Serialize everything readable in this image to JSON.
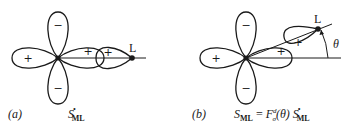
{
  "panel_a": {
    "tag": "(a)",
    "ligand_label": "L",
    "signs": {
      "top": "−",
      "bottom": "−",
      "left": "+",
      "right": "+",
      "ligand": "+"
    },
    "formula": {
      "S": "S",
      "star": "•",
      "sub": "ML"
    }
  },
  "panel_b": {
    "tag": "(b)",
    "ligand_label": "L",
    "angle_label": "θ",
    "angle_deg": 22,
    "signs": {
      "top": "−",
      "bottom": "−",
      "left": "+",
      "right": "+",
      "ligand": "+"
    },
    "formula": {
      "lhs": "S",
      "lhs_sub": "ML",
      "eq": " = ",
      "F": "F",
      "F_sup": "d",
      "F_sub": "σ",
      "arg": "(θ) ",
      "rhs": "S",
      "rhs_star": "•",
      "rhs_sub": "ML"
    }
  }
}
